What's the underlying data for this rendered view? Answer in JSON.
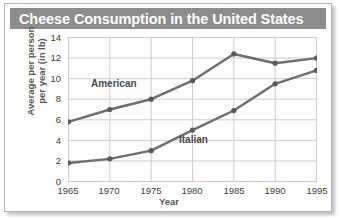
{
  "figure": {
    "title": "Cheese Consumption in the United States",
    "title_bg": "#8d8d8d",
    "title_color": "#ffffff",
    "panel_bg": "#ffffff",
    "border_color": "#b4b4b4"
  },
  "chart_data": {
    "type": "line",
    "title": "Cheese Consumption in the United States",
    "xlabel": "Year",
    "ylabel": "Average per person\nper year (in lb)",
    "categories": [
      1965,
      1970,
      1975,
      1980,
      1985,
      1990,
      1995
    ],
    "x_ticklabels": [
      "1965",
      "1970",
      "1975",
      "1980",
      "1985",
      "1990",
      "1995"
    ],
    "y_ticklabels": [
      "0",
      "2",
      "4",
      "6",
      "8",
      "10",
      "12",
      "14"
    ],
    "yticks": [
      0,
      2,
      4,
      6,
      8,
      10,
      12,
      14
    ],
    "ylim": [
      0,
      14
    ],
    "xlim": [
      1965,
      1995
    ],
    "grid": true,
    "legend": "inline-labels",
    "line_color": "#6e6e6e",
    "marker_color": "#5a5a5a",
    "grid_color": "#c8c8c8",
    "series": [
      {
        "name": "American",
        "label_x": 86,
        "label_y": 74,
        "values": [
          5.8,
          7.0,
          8.0,
          9.8,
          12.4,
          11.5,
          12.0
        ]
      },
      {
        "name": "Italian",
        "label_x": 174,
        "label_y": 130,
        "values": [
          1.8,
          2.2,
          3.0,
          5.0,
          6.9,
          9.5,
          10.8
        ]
      }
    ]
  }
}
